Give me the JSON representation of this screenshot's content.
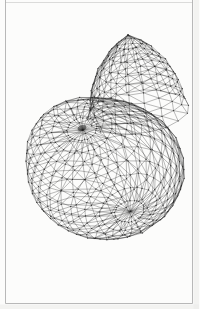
{
  "figure": {
    "type": "wireframe-mesh-plate",
    "canvas": {
      "width": 199,
      "height": 309,
      "background": "#fcfcfb"
    },
    "frame": {
      "left": 5.5,
      "right": 192.5,
      "top": 2.5,
      "bottom": 303.5,
      "stroke": "#ababab",
      "stroke_width": 1,
      "side_opacity": 0.85,
      "top_opacity": 0.4,
      "page_edge_fill": "#ededeb",
      "page_edge_opacity": 0.6
    },
    "wireframe": {
      "stroke": "#222222",
      "stroke_width": 0.5,
      "stroke_opacity": 0.62,
      "jitter": 1.6,
      "body": {
        "center": [
          106,
          170
        ],
        "radii": [
          78,
          70,
          78
        ],
        "pole_dir": [
          -0.308,
          -0.6,
          0.738
        ],
        "meridians": 28,
        "rings": 16,
        "lobe_bump": {
          "dir": [
            -0.654,
            -0.738,
            0.169
          ],
          "amplitude": 0.15,
          "sigma": 0.42
        },
        "pole_pinch": {
          "amplitude": 0.07,
          "sigma": 0.22
        }
      },
      "dome": {
        "apex": [
          128,
          35,
          26
        ],
        "base": [
          137,
          103,
          -6
        ],
        "base_radius": 47,
        "skirt_radius": 51,
        "profile_pow": 0.8,
        "meridians": 18,
        "ring_positions": [
          0,
          0.13,
          0.26,
          0.38,
          0.5,
          0.62,
          0.74,
          0.87,
          1,
          1.14
        ]
      },
      "vertex_dots": {
        "radius": 0.6,
        "opacity": 0.32,
        "fill": "#1a1a1a"
      },
      "spiral_knot": {
        "cx": 82,
        "cy": 128,
        "rx": 4.5,
        "ry": 2.8,
        "rotate": -18,
        "fill": "#1a1a1a",
        "opacity": 0.5
      }
    }
  }
}
